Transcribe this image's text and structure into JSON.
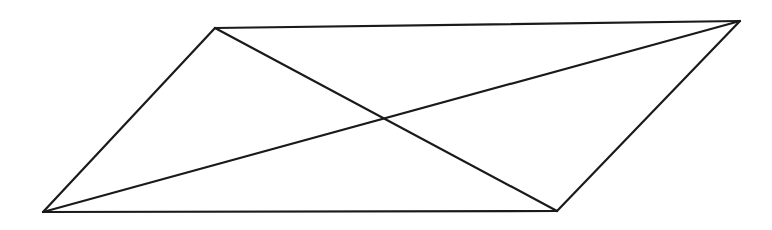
{
  "diagram": {
    "shape": "parallelogram",
    "stroke_color": "#1a1a1a",
    "stroke_width": 2.2,
    "background": "#ffffff",
    "vertices": {
      "top_left": [
        215,
        28
      ],
      "top_right": [
        740,
        21
      ],
      "bottom_right": [
        557,
        211
      ],
      "bottom_left": [
        43,
        212
      ]
    },
    "edges": [
      {
        "name": "top-edge",
        "from": "top_left",
        "to": "top_right"
      },
      {
        "name": "right-edge",
        "from": "top_right",
        "to": "bottom_right"
      },
      {
        "name": "bottom-edge",
        "from": "bottom_right",
        "to": "bottom_left"
      },
      {
        "name": "left-edge",
        "from": "bottom_left",
        "to": "top_left"
      }
    ],
    "diagonals": [
      {
        "name": "diagonal-top-left-to-bottom-right",
        "from": "top_left",
        "to": "bottom_right"
      },
      {
        "name": "diagonal-bottom-left-to-top-right",
        "from": "bottom_left",
        "to": "top_right"
      }
    ],
    "intersection": [
      385,
      118
    ]
  }
}
